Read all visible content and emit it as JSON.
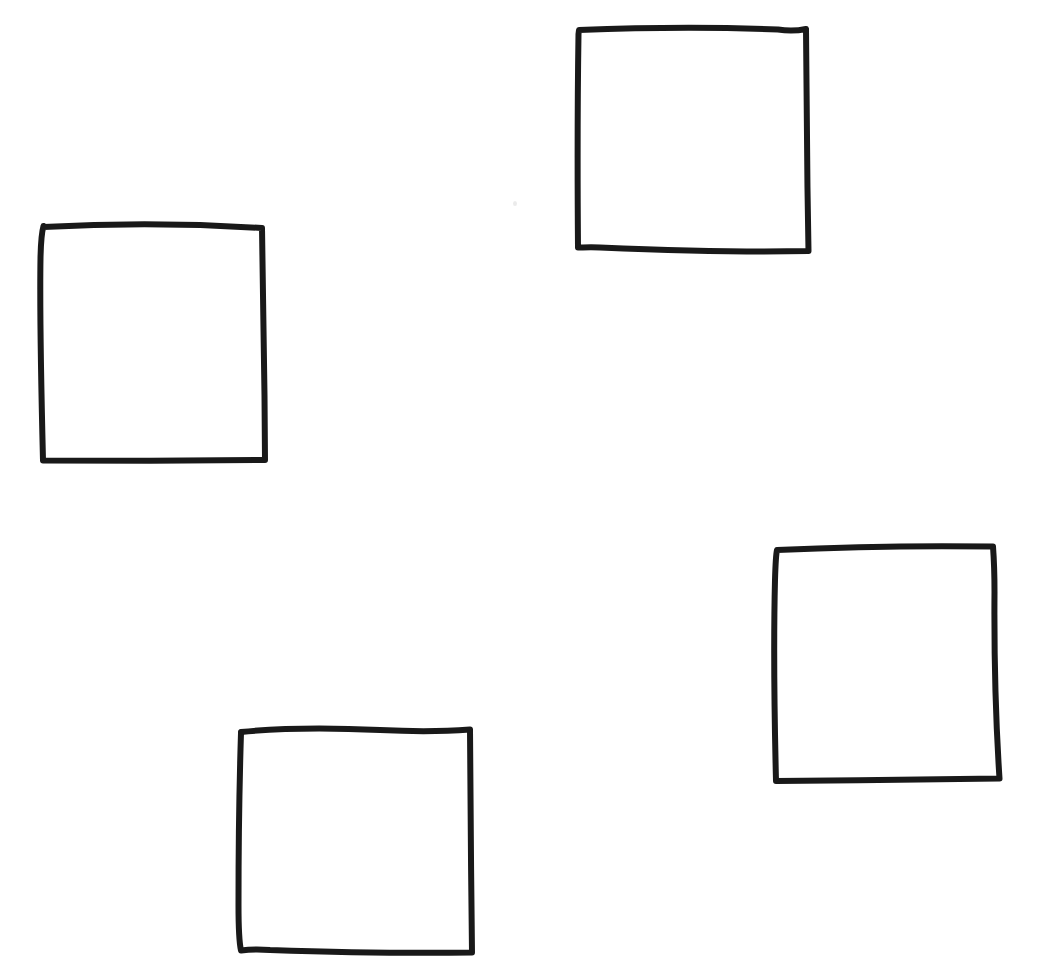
{
  "document": {
    "kind": "hand-drawn-sketch",
    "title": "Four hand-drawn squares",
    "medium": "black marker on white paper",
    "background_color": "#ffffff",
    "ink_color": "#191919",
    "canvas": {
      "width": 1048,
      "height": 963
    },
    "shape_count": 4,
    "shape_type": "square",
    "visible_text": ""
  },
  "shapes": [
    {
      "id": "square-top-left",
      "label": "square-top-left",
      "position": "upper-left",
      "bbox": {
        "x": 40,
        "y": 222,
        "width": 226,
        "height": 242
      },
      "corners": {
        "top_left": [
          43,
          225
        ],
        "top_right": [
          263,
          228
        ],
        "bottom_right": [
          265,
          461
        ],
        "bottom_left": [
          42,
          460
        ]
      },
      "stroke_width": 6,
      "ink_color": "#191919",
      "path": "M 43.5 227 C 110 223.5, 190 223.5, 262 228 C 263.5 290, 264.5 380, 265 460 C 200 460.5, 110 461, 43 460.5 C 41.5 400, 39.5 320, 40.5 258 C 40.8 244, 41.5 233, 43.5 226 Z"
    },
    {
      "id": "square-top-right",
      "label": "square-top-right",
      "position": "upper-right",
      "bbox": {
        "x": 576,
        "y": 26,
        "width": 234,
        "height": 229
      },
      "corners": {
        "top_left": [
          579,
          29
        ],
        "top_right": [
          806,
          30
        ],
        "bottom_right": [
          808,
          252
        ],
        "bottom_left": [
          578,
          247
        ]
      },
      "stroke_width": 6,
      "ink_color": "#191919",
      "path": "M 579 30 C 640 27.5, 720 27, 778 29.5 C 790 31.5, 799 30.5, 806 29 C 806.5 90, 807 175, 808.5 251 C 745 252.5, 660 250, 600 247.5 C 590 247, 583 247.5, 578 247.5 C 577.5 185, 577.5 100, 578.5 34 Z"
    },
    {
      "id": "square-bottom-center",
      "label": "square-bottom-center",
      "position": "lower-center",
      "bbox": {
        "x": 238,
        "y": 725,
        "width": 234,
        "height": 230
      },
      "corners": {
        "top_left": [
          241,
          731
        ],
        "top_right": [
          471,
          729
        ],
        "bottom_right": [
          472,
          953
        ],
        "bottom_left": [
          240,
          948
        ]
      },
      "stroke_width": 6,
      "ink_color": "#191919",
      "path": "M 241 732 C 280 728, 330 727.5, 380 730 C 420 732, 450 731, 470 729.5 C 470.5 790, 471 880, 472 952.5 C 410 953.5, 330 952, 270 950 C 258 949, 248 949.5, 241 950.5 C 239.5 944, 238.5 930, 238.5 905 C 238.5 850, 239.5 780, 241 733 Z"
    },
    {
      "id": "square-right-lower",
      "label": "square-right-lower",
      "position": "right-lower",
      "bbox": {
        "x": 773,
        "y": 543,
        "width": 228,
        "height": 239
      },
      "corners": {
        "top_left": [
          777,
          549
        ],
        "top_right": [
          995,
          546
        ],
        "bottom_right": [
          1000,
          779
        ],
        "bottom_left": [
          775,
          781
        ]
      },
      "stroke_width": 6,
      "ink_color": "#191919",
      "path": "M 777 550 C 840 547, 920 545.5, 993 546.5 C 994 560, 994.5 575, 994.5 592 C 994 660, 996 725, 999.5 778.5 C 930 779.5, 850 780.5, 776 781 C 774.5 720, 773.5 640, 775 580 C 775.5 563, 776 554, 777 550 Z"
    }
  ],
  "artifacts": [
    {
      "id": "paper-speck",
      "label": "paper-speck",
      "x": 513,
      "y": 201,
      "color": "#e8e8e8"
    }
  ]
}
